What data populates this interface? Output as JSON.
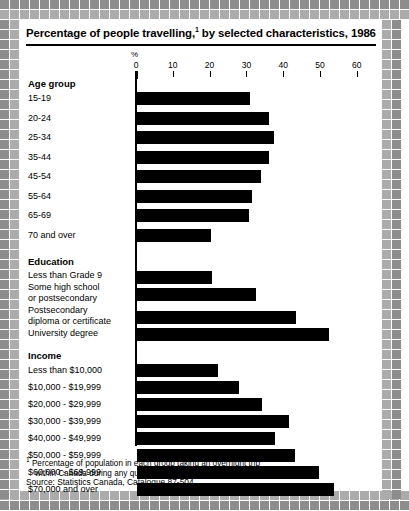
{
  "title": {
    "text_before": "Percentage of people travelling,",
    "footnote_marker": "1",
    "text_after": " by selected characteristics, 1986"
  },
  "axis": {
    "unit_label": "%",
    "ticks": [
      0,
      10,
      20,
      30,
      40,
      50,
      60
    ]
  },
  "footnote": {
    "marker": "1",
    "line1": "Percentage of population in each group taking an overnight trip",
    "line2": "within Canada during any quarter of the year.",
    "source": "Source: Statistics Canada, Catalogue 87-504."
  },
  "colors": {
    "bar": "#000000",
    "border_dark": "#8d8d8d",
    "border_light": "#ababab",
    "text": "#000000",
    "panel_background": "#ffffff"
  },
  "chart_data": {
    "type": "bar",
    "orientation": "horizontal",
    "xlabel": "%",
    "ylabel": "",
    "xlim": [
      0,
      60
    ],
    "xticks": [
      0,
      10,
      20,
      30,
      40,
      50,
      60
    ],
    "grid": false,
    "legend": null,
    "groups": [
      {
        "name": "Age group",
        "categories": [
          "15-19",
          "20-24",
          "25-34",
          "35-44",
          "45-54",
          "55-64",
          "65-69",
          "70 and over"
        ],
        "values": [
          30.7,
          36.0,
          37.3,
          36.0,
          33.7,
          31.2,
          30.4,
          20.0
        ]
      },
      {
        "name": "Education",
        "categories": [
          "Less than Grade 9",
          "Some high school or postsecondary",
          "Postsecondary diploma or certificate",
          "University degree"
        ],
        "values": [
          20.5,
          32.3,
          43.2,
          52.3
        ]
      },
      {
        "name": "Income",
        "categories": [
          "Less than $10,000",
          "$10,000 - $19,999",
          "$20,000 - $29,999",
          "$30,000 - $39,999",
          "$40,000 - $49,999",
          "$50,000 - $59,999",
          "$60,000 - $69,999",
          "$70,000 and over"
        ],
        "values": [
          22.0,
          27.6,
          34.0,
          41.4,
          37.6,
          43.0,
          49.5,
          53.4
        ]
      }
    ]
  },
  "labels": {
    "age_group_header": "Age group",
    "education_header": "Education",
    "income_header": "Income",
    "age": [
      "15-19",
      "20-24",
      "25-34",
      "35-44",
      "45-54",
      "55-64",
      "65-69",
      "70 and over"
    ],
    "education": [
      [
        "Less than Grade 9"
      ],
      [
        "Some high school",
        "or postsecondary"
      ],
      [
        "Postsecondary",
        "diploma or certificate"
      ],
      [
        "University degree"
      ]
    ],
    "income": [
      "Less than $10,000",
      "$10,000 - $19,999",
      "$20,000 - $29,999",
      "$30,000 - $39,999",
      "$40,000 - $49,999",
      "$50,000 - $59,999",
      "$60,000 - $69,999",
      "$70,000 and over"
    ]
  }
}
